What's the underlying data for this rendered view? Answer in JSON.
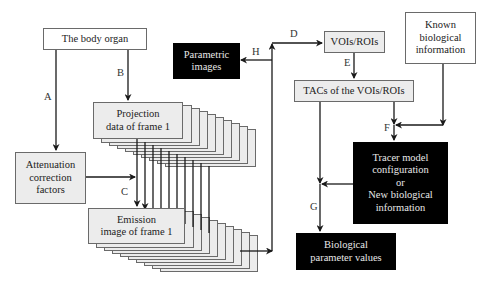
{
  "diagram": {
    "nodes": {
      "body_organ": "The body organ",
      "parametric_images": "Parametric\nimages",
      "vois_rois": "VOIs/ROIs",
      "known_info": "Known\nbiological\ninformation",
      "projection": "Projection\ndata of frame 1",
      "tacs": "TACs of the VOIs/ROIs",
      "attenuation": "Attenuation\ncorrection\nfactors",
      "tracer_model": "Tracer model\nconfiguration\nor\nNew biological\ninformation",
      "emission": "Emission\nimage of frame 1",
      "bio_params": "Biological\nparameter values"
    },
    "edge_labels": {
      "A": "A",
      "B": "B",
      "C": "C",
      "D": "D",
      "E": "E",
      "F": "F",
      "G": "G",
      "H": "H"
    },
    "stack_frames": 10,
    "colors": {
      "line": "#1a1a1a",
      "gray_fill": "#ececec",
      "black_fill": "#000000"
    }
  }
}
